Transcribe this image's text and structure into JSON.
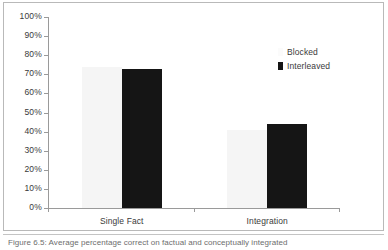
{
  "figure": {
    "caption": "Figure 6.5: Average percentage correct on factual and conceptually integrated"
  },
  "legend": {
    "items": [
      {
        "label": "Blocked",
        "color": "#fbfbfb"
      },
      {
        "label": "Interleaved",
        "color": "#151515"
      }
    ]
  },
  "axis": {
    "y_ticks": [
      "100%",
      "90%",
      "80%",
      "70%",
      "60%",
      "50%",
      "40%",
      "30%",
      "20%",
      "10%",
      "0%"
    ]
  },
  "categories": [
    "Single Fact",
    "Integration"
  ],
  "chart_data": {
    "type": "bar",
    "title": "",
    "xlabel": "",
    "ylabel": "",
    "categories": [
      "Single Fact",
      "Integration"
    ],
    "series": [
      {
        "name": "Blocked",
        "color": "#f5f5f5",
        "values": [
          74,
          41
        ]
      },
      {
        "name": "Interleaved",
        "color": "#151515",
        "values": [
          73,
          44
        ]
      }
    ],
    "ylim": [
      0,
      100
    ],
    "ytick_values": [
      0,
      10,
      20,
      30,
      40,
      50,
      60,
      70,
      80,
      90,
      100
    ],
    "ytick_labels": [
      "0%",
      "10%",
      "20%",
      "30%",
      "40%",
      "50%",
      "60%",
      "70%",
      "80%",
      "90%",
      "100%"
    ],
    "ytick_format": "percent",
    "grid": false,
    "legend_position": "inside-top-right"
  }
}
